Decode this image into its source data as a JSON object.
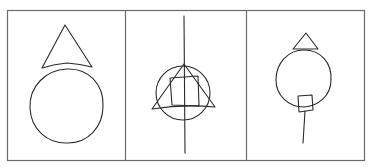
{
  "diagram": {
    "description": "Three-panel hand-drawn sketch of geometric shapes",
    "colors": {
      "ink": "#2a2a2a",
      "frame": "#6a6a6a",
      "background": "#ffffff"
    },
    "panels": [
      {
        "label": "Panel 1: triangle above a large circle",
        "shapes": [
          "triangle",
          "circle"
        ]
      },
      {
        "label": "Panel 2: circle, triangle and square overlapping on a vertical line",
        "shapes": [
          "vertical-line",
          "circle",
          "triangle",
          "square"
        ]
      },
      {
        "label": "Panel 3: small triangle atop a circle, small rectangle and stick below",
        "shapes": [
          "triangle",
          "circle",
          "rectangle",
          "line"
        ]
      }
    ]
  }
}
